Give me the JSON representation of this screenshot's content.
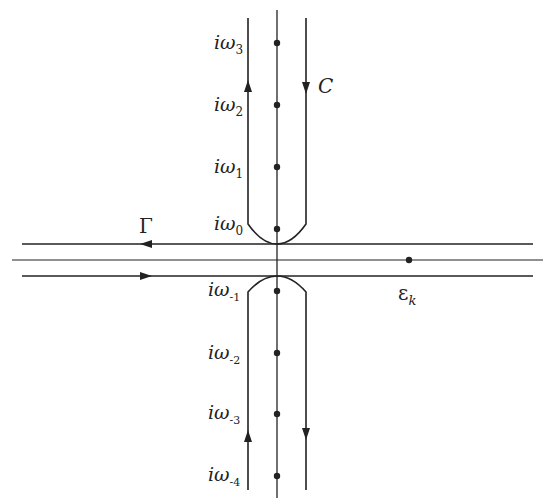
{
  "diagram": {
    "type": "contour-integral-complex-plane",
    "colors": {
      "line": "#222222",
      "background": "#ffffff"
    },
    "contours": {
      "C": {
        "label": "C",
        "direction_left_branch": "up",
        "direction_right_branch": "down"
      },
      "Gamma": {
        "label": "Γ",
        "direction_upper": "left",
        "direction_lower": "right"
      }
    },
    "poles": [
      {
        "base": "iω",
        "sub": "3",
        "y": 43
      },
      {
        "base": "iω",
        "sub": "2",
        "y": 105
      },
      {
        "base": "iω",
        "sub": "1",
        "y": 167
      },
      {
        "base": "iω",
        "sub": "0",
        "y": 229
      },
      {
        "base": "iω",
        "sub": "-1",
        "y": 291
      },
      {
        "base": "iω",
        "sub": "-2",
        "y": 353
      },
      {
        "base": "iω",
        "sub": "-3",
        "y": 414
      },
      {
        "base": "iω",
        "sub": "-4",
        "y": 476
      }
    ],
    "real_pole": {
      "base": "ε",
      "sub": "k",
      "x": 409
    }
  }
}
